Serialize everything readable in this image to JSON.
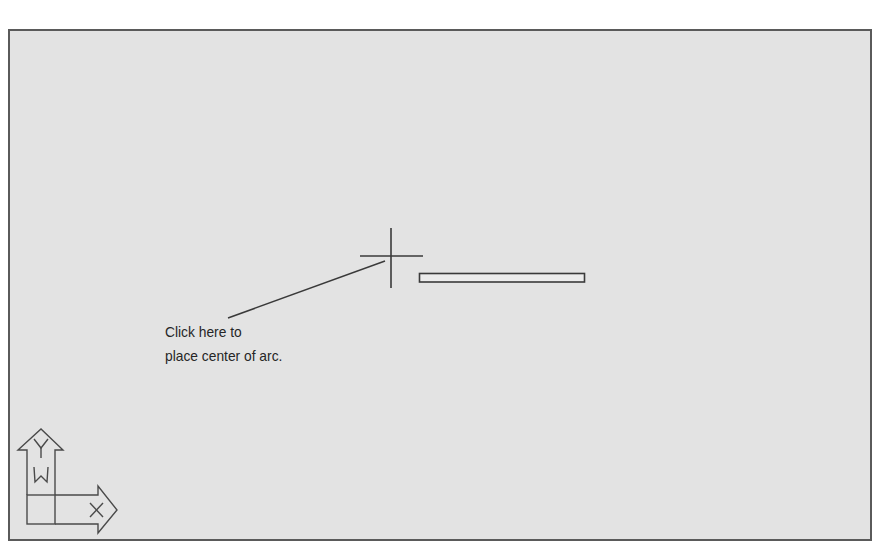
{
  "drawing_area": {
    "background": "#e3e3e3",
    "border_color": "#5a5a5a"
  },
  "crosshair": {
    "x": 391,
    "y": 256
  },
  "rubberband_rectangle": {
    "x1": 419,
    "y1": 273,
    "x2": 585,
    "y2": 282
  },
  "callout": {
    "line1": "Click here to",
    "line2": "place center of arc."
  },
  "ucs_icon": {
    "y_label": "Y",
    "w_label": "W",
    "x_label": "X"
  }
}
